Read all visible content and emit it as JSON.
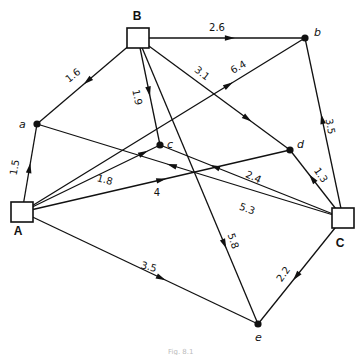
{
  "diagram": {
    "type": "directed-network",
    "nodes": [
      {
        "id": "B",
        "label": "B",
        "kind": "square",
        "x": 138,
        "y": 38,
        "lx": 137,
        "ly": 20
      },
      {
        "id": "b",
        "label": "b",
        "kind": "dot",
        "x": 305,
        "y": 38,
        "lx": 314,
        "ly": 36
      },
      {
        "id": "a",
        "label": "a",
        "kind": "dot",
        "x": 37,
        "y": 124,
        "lx": 19,
        "ly": 128
      },
      {
        "id": "c",
        "label": "c",
        "kind": "dot",
        "x": 160,
        "y": 145,
        "lx": 167,
        "ly": 148
      },
      {
        "id": "d",
        "label": "d",
        "kind": "dot",
        "x": 290,
        "y": 150,
        "lx": 297,
        "ly": 148
      },
      {
        "id": "A",
        "label": "A",
        "kind": "square",
        "x": 22,
        "y": 212,
        "lx": 18,
        "ly": 235
      },
      {
        "id": "C",
        "label": "C",
        "kind": "square",
        "x": 343,
        "y": 218,
        "lx": 340,
        "ly": 247
      },
      {
        "id": "e",
        "label": "e",
        "kind": "dot",
        "x": 258,
        "y": 324,
        "lx": 255,
        "ly": 341
      }
    ],
    "edges": [
      {
        "from": "B",
        "to": "b",
        "weight": "2.6",
        "t": 0.55,
        "lx": 217,
        "ly": 31,
        "rot": 0
      },
      {
        "from": "B",
        "to": "a",
        "weight": "1.6",
        "t": 0.5,
        "lx": 75,
        "ly": 78,
        "rot": -38
      },
      {
        "from": "B",
        "to": "c",
        "weight": "1.9",
        "t": 0.5,
        "lx": 134,
        "ly": 98,
        "rot": 78
      },
      {
        "from": "B",
        "to": "d",
        "weight": "3.1",
        "t": 0.72,
        "lx": 200,
        "ly": 76,
        "rot": 38
      },
      {
        "from": "B",
        "to": "e",
        "weight": "5.8",
        "t": 0.72,
        "lx": 230,
        "ly": 242,
        "rot": 72
      },
      {
        "from": "A",
        "to": "a",
        "weight": "1.5",
        "t": 0.5,
        "lx": 18,
        "ly": 168,
        "rot": -80
      },
      {
        "from": "A",
        "to": "b",
        "weight": "6.4",
        "t": 0.73,
        "lx": 240,
        "ly": 70,
        "rot": -30
      },
      {
        "from": "A",
        "to": "c",
        "weight": "1.8",
        "t": 0.88,
        "lx": 104,
        "ly": 183,
        "rot": 15
      },
      {
        "from": "A",
        "to": "d",
        "weight": "4",
        "t": 0.52,
        "lx": 157,
        "ly": 196,
        "rot": 0
      },
      {
        "from": "A",
        "to": "e",
        "weight": "3.5",
        "t": 0.59,
        "lx": 148,
        "ly": 270,
        "rot": 15
      },
      {
        "from": "C",
        "to": "b",
        "weight": "3.5",
        "t": 0.55,
        "lx": 327,
        "ly": 127,
        "rot": 80
      },
      {
        "from": "C",
        "to": "d",
        "weight": "1.3",
        "t": 0.58,
        "lx": 318,
        "ly": 177,
        "rot": 55
      },
      {
        "from": "C",
        "to": "c",
        "weight": "2.4",
        "t": 0.7,
        "lx": 252,
        "ly": 180,
        "rot": 25
      },
      {
        "from": "C",
        "to": "a",
        "weight": "5.3",
        "t": 0.56,
        "lx": 246,
        "ly": 212,
        "rot": 20
      },
      {
        "from": "C",
        "to": "e",
        "weight": "2.2",
        "t": 0.55,
        "lx": 286,
        "ly": 276,
        "rot": -55
      }
    ],
    "caption": "Fig. 8.1"
  }
}
